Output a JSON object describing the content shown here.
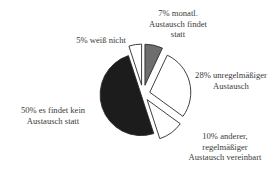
{
  "chart_data": {
    "type": "pie",
    "title": "",
    "exploded": true,
    "start_angle_deg": 0,
    "direction": "clockwise",
    "slices": [
      {
        "label": "7% monatl. Austausch findet statt",
        "value": 7,
        "fill": "#6e6e6e"
      },
      {
        "label": "28% unregelmäßiger Austausch",
        "value": 28,
        "fill": "#ffffff"
      },
      {
        "label": "10% anderer, regelmäßiger Austausch vereinbart",
        "value": 10,
        "fill": "#ffffff"
      },
      {
        "label": "50% es findet kein Austausch statt",
        "value": 50,
        "fill": "#1c1c1c"
      },
      {
        "label": "5% weiß nicht",
        "value": 5,
        "fill": "#ffffff"
      }
    ]
  },
  "labels": {
    "monthly": [
      "7% monatl.",
      "Austausch findet",
      "statt"
    ],
    "irregular": [
      "28% unregelmäßiger",
      "Austausch"
    ],
    "other": [
      "10% anderer,",
      "regelmäßiger",
      "Austausch vereinbart"
    ],
    "none": [
      "50% es findet kein",
      "Austausch statt"
    ],
    "unknown": [
      "5% weiß nicht"
    ]
  }
}
